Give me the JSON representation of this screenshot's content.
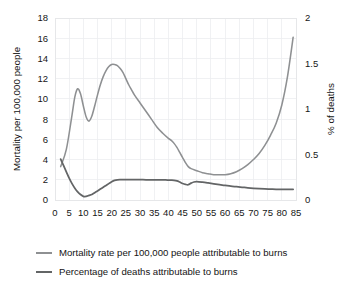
{
  "chart_data": {
    "type": "line",
    "title": "",
    "subtitle": "",
    "xlabel": "",
    "ylabel": "Mortality per 100,000 people",
    "y2label": "% of deaths",
    "xlim": [
      0,
      85
    ],
    "ylim": [
      0,
      18
    ],
    "y2lim": [
      0,
      2
    ],
    "grid": true,
    "legend_position": "bottom-left",
    "xticks": [
      0,
      5,
      10,
      15,
      20,
      25,
      30,
      35,
      40,
      45,
      50,
      55,
      60,
      65,
      70,
      75,
      80,
      85
    ],
    "xticklabels": [
      "0",
      "5",
      "10",
      "15",
      "20",
      "25",
      "30",
      "35",
      "40",
      "45",
      "50",
      "55",
      "60",
      "65",
      "70",
      "75",
      "80",
      "85"
    ],
    "yticks": [
      0,
      2,
      4,
      6,
      8,
      10,
      12,
      14,
      16,
      18
    ],
    "yticklabels": [
      "0",
      "2",
      "4",
      "6",
      "8",
      "10",
      "12",
      "14",
      "16",
      "18"
    ],
    "y2ticks": [
      0,
      0.5,
      1,
      1.5,
      2
    ],
    "y2ticklabels": [
      "0",
      "0.5",
      "1",
      "1.5",
      "2"
    ],
    "series": [
      {
        "name": "Mortality rate per 100,000 people attributable to burns",
        "axis": "left",
        "color": "#8e9092",
        "x": [
          2,
          4,
          6,
          7,
          8,
          9,
          10,
          11,
          12,
          13,
          14,
          15,
          16,
          17,
          18,
          19,
          20,
          21,
          22,
          23,
          24,
          25,
          26,
          27,
          28,
          30,
          32,
          34,
          36,
          38,
          40,
          41,
          42,
          43,
          44,
          45,
          46,
          47,
          48,
          50,
          52,
          54,
          56,
          58,
          60,
          62,
          64,
          66,
          68,
          70,
          72,
          74,
          76,
          78,
          80,
          82,
          84
        ],
        "y": [
          3.3,
          5.0,
          8.4,
          10.2,
          11.0,
          10.5,
          9.3,
          8.2,
          7.8,
          8.3,
          9.3,
          10.4,
          11.4,
          12.2,
          12.8,
          13.2,
          13.4,
          13.4,
          13.3,
          13.0,
          12.6,
          12.0,
          11.4,
          10.9,
          10.4,
          9.6,
          8.8,
          8.0,
          7.2,
          6.6,
          6.1,
          5.9,
          5.6,
          5.2,
          4.7,
          4.2,
          3.7,
          3.3,
          3.1,
          2.9,
          2.7,
          2.6,
          2.5,
          2.5,
          2.5,
          2.6,
          2.8,
          3.1,
          3.5,
          4.0,
          4.6,
          5.4,
          6.4,
          7.6,
          9.4,
          12.2,
          16.1
        ]
      },
      {
        "name": "Percentage of deaths attributable to burns",
        "axis": "right",
        "color": "#636566",
        "x": [
          2,
          3,
          4,
          5,
          6,
          7,
          8,
          9,
          10,
          11,
          12,
          13,
          14,
          15,
          16,
          17,
          18,
          19,
          20,
          21,
          22,
          23,
          24,
          25,
          27,
          29,
          31,
          33,
          35,
          37,
          39,
          41,
          42,
          43,
          44,
          45,
          46,
          47,
          48,
          49,
          50,
          52,
          54,
          56,
          58,
          60,
          62,
          64,
          66,
          68,
          70,
          72,
          74,
          76,
          78,
          80,
          82,
          84
        ],
        "y": [
          0.45,
          0.38,
          0.31,
          0.24,
          0.18,
          0.13,
          0.09,
          0.06,
          0.04,
          0.04,
          0.05,
          0.06,
          0.08,
          0.1,
          0.12,
          0.14,
          0.16,
          0.18,
          0.2,
          0.215,
          0.222,
          0.224,
          0.224,
          0.224,
          0.224,
          0.223,
          0.223,
          0.222,
          0.222,
          0.221,
          0.22,
          0.218,
          0.216,
          0.21,
          0.197,
          0.182,
          0.172,
          0.168,
          0.185,
          0.198,
          0.202,
          0.196,
          0.187,
          0.177,
          0.168,
          0.16,
          0.152,
          0.146,
          0.14,
          0.134,
          0.129,
          0.125,
          0.122,
          0.12,
          0.118,
          0.117,
          0.117,
          0.118
        ]
      }
    ],
    "legend": [
      {
        "label": "Mortality rate per 100,000 people attributable to burns",
        "color": "#8e9092"
      },
      {
        "label": "Percentage of deaths attributable to burns",
        "color": "#636566"
      }
    ],
    "colors": {
      "mortality_line": "#8e9092",
      "percent_line": "#636566",
      "grid": "#eceef0",
      "text": "#141414",
      "background": "#ffffff"
    }
  }
}
